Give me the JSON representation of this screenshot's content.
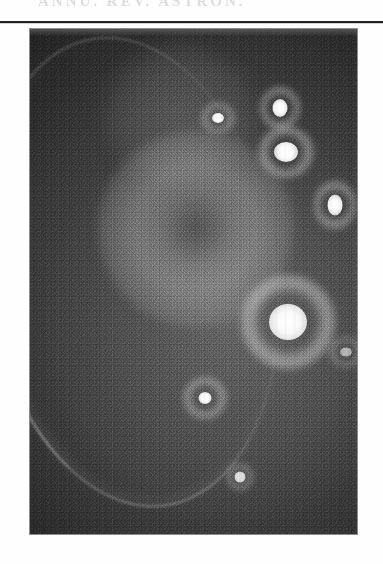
{
  "page": {
    "background_color": "#fefefe",
    "width": 383,
    "height": 564
  },
  "header": {
    "running_head": "ANNU. REV. ASTRON.",
    "note": "faint ghosted text clipped at page top",
    "color": "#d8d8d8"
  },
  "rule": {
    "color": "#202020"
  },
  "figure": {
    "caption": "",
    "plate": {
      "type": "halftone-photograph",
      "background_color": "#3a3a3a",
      "highlight_color": "#ffffff",
      "left": 30,
      "top": 29,
      "width": 327,
      "height": 505
    },
    "features": [
      {
        "name": "bright-source-upper-left",
        "x": 188,
        "y": 89,
        "core": 12,
        "ring": 34,
        "brightness": 0.72
      },
      {
        "name": "bright-source-upper-mid",
        "x": 250,
        "y": 79,
        "core": 15,
        "ring": 40,
        "brightness": 0.88
      },
      {
        "name": "bright-source-upper-right",
        "x": 256,
        "y": 123,
        "core": 22,
        "ring": 56,
        "brightness": 0.96
      },
      {
        "name": "bright-source-right-edge",
        "x": 305,
        "y": 176,
        "core": 16,
        "ring": 42,
        "brightness": 0.9
      },
      {
        "name": "bright-source-principal",
        "x": 258,
        "y": 293,
        "core": 36,
        "ring": 96,
        "brightness": 1.0
      },
      {
        "name": "bright-source-lower-left",
        "x": 175,
        "y": 369,
        "core": 14,
        "ring": 44,
        "brightness": 0.74
      },
      {
        "name": "bright-source-lower-mid",
        "x": 210,
        "y": 448,
        "core": 11,
        "ring": 26,
        "brightness": 0.55
      },
      {
        "name": "bright-patch-right-edge",
        "x": 316,
        "y": 323,
        "core": 10,
        "ring": 34,
        "brightness": 0.48
      }
    ],
    "arc": {
      "name": "luminous-arc",
      "description": "thin curved filament sweeping down the left side of the plate",
      "brightness": 0.66
    }
  }
}
